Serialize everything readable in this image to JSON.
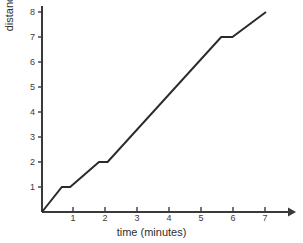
{
  "chart_data": {
    "type": "line",
    "title": "",
    "subtitle": "",
    "xlabel": "time (minutes)",
    "ylabel": "distance (blocks)",
    "xlim": [
      0,
      7.6
    ],
    "ylim": [
      0,
      8.4
    ],
    "grid": false,
    "legend": null,
    "legend_position": "none",
    "x_ticks": [
      1,
      2,
      3,
      4,
      5,
      6,
      7
    ],
    "x_tick_labels": [
      "1",
      "2",
      "3",
      "4",
      "5",
      "6",
      "7"
    ],
    "y_ticks": [
      1,
      2,
      3,
      4,
      5,
      6,
      7,
      8
    ],
    "y_tick_labels": [
      "1",
      "2",
      "3",
      "4",
      "5",
      "6",
      "7",
      "8"
    ],
    "line_color": "#2b2b2b",
    "axis_color": "#3a3a3a",
    "background_color": "#ffffff",
    "annotations": [],
    "series": [
      {
        "name": "distance travelled",
        "x": [
          0,
          0.62,
          0.88,
          1.78,
          2.05,
          5.6,
          5.95,
          7.0
        ],
        "y": [
          0,
          1.0,
          1.0,
          2.0,
          2.0,
          7.0,
          7.0,
          8.0
        ],
        "description": "Distance increases steadily with three brief pauses (flat segments) at 1, 2 and 7 blocks."
      }
    ]
  }
}
